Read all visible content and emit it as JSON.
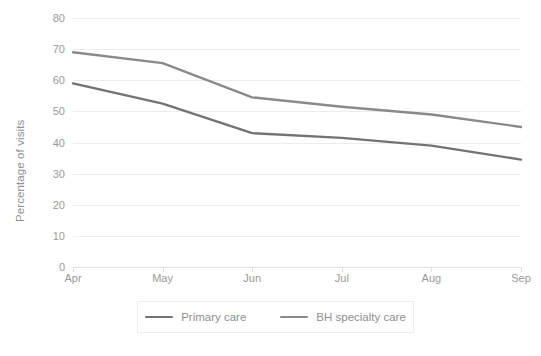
{
  "chart_data": {
    "type": "line",
    "title": "",
    "subtitle": "",
    "xlabel": "",
    "ylabel": "Percentage of visits",
    "categories": [
      "Apr",
      "May",
      "Jun",
      "Jul",
      "Aug",
      "Sep"
    ],
    "series": [
      {
        "name": "Primary care",
        "color": "#737373",
        "values": [
          59,
          52.5,
          43,
          41.5,
          39,
          34.5
        ]
      },
      {
        "name": "BH specialty care",
        "color": "#8a8a8a",
        "values": [
          69,
          65.5,
          54.5,
          51.5,
          49,
          45
        ]
      }
    ],
    "ylim": [
      0,
      80
    ],
    "y_ticks": [
      0,
      10,
      20,
      30,
      40,
      50,
      60,
      70,
      80
    ],
    "y_tick_labels": [
      "0",
      "10",
      "20",
      "30",
      "40",
      "50",
      "60",
      "70",
      "80"
    ],
    "grid": true,
    "grid_color": "#ececec",
    "legend_position": "bottom",
    "legend_entries": [
      "Primary care",
      "BH specialty care"
    ]
  },
  "legend": {
    "items": [
      {
        "label": "Primary care"
      },
      {
        "label": "BH specialty care"
      }
    ]
  },
  "axes": {
    "y_title": "Percentage of visits"
  }
}
